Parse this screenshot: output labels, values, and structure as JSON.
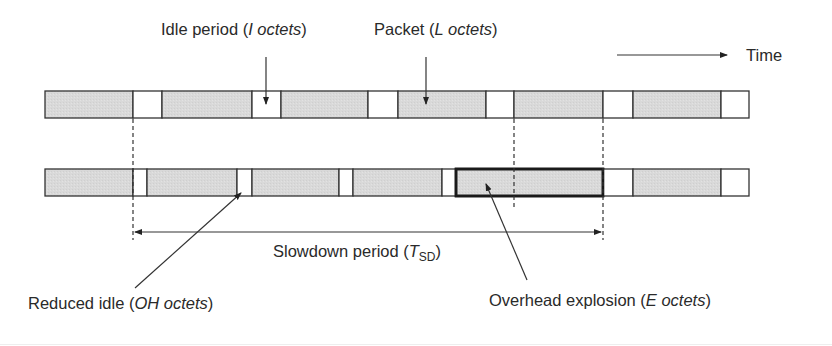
{
  "diagram": {
    "title": "",
    "colors": {
      "packet_fill": "#d9d9d9",
      "idle_fill": "#ffffff",
      "stroke": "#333333"
    },
    "time_axis": {
      "label": "Time"
    },
    "rows": [
      {
        "name": "original-stream",
        "y": 91,
        "height": 27,
        "segments": [
          {
            "type": "packet",
            "x0": 45,
            "x1": 133
          },
          {
            "type": "idle",
            "x0": 133,
            "x1": 162
          },
          {
            "type": "packet",
            "x0": 162,
            "x1": 252
          },
          {
            "type": "idle",
            "x0": 252,
            "x1": 281
          },
          {
            "type": "packet",
            "x0": 281,
            "x1": 368
          },
          {
            "type": "idle",
            "x0": 368,
            "x1": 398
          },
          {
            "type": "packet",
            "x0": 398,
            "x1": 486
          },
          {
            "type": "idle",
            "x0": 486,
            "x1": 514
          },
          {
            "type": "packet",
            "x0": 514,
            "x1": 603
          },
          {
            "type": "idle",
            "x0": 603,
            "x1": 633
          },
          {
            "type": "packet",
            "x0": 633,
            "x1": 721
          },
          {
            "type": "idle",
            "x0": 721,
            "x1": 749
          }
        ]
      },
      {
        "name": "slowed-stream",
        "y": 169,
        "height": 27,
        "segments": [
          {
            "type": "packet",
            "x0": 45,
            "x1": 133
          },
          {
            "type": "idle",
            "x0": 133,
            "x1": 147
          },
          {
            "type": "packet",
            "x0": 147,
            "x1": 237
          },
          {
            "type": "idle",
            "x0": 237,
            "x1": 252
          },
          {
            "type": "packet",
            "x0": 252,
            "x1": 339
          },
          {
            "type": "idle",
            "x0": 339,
            "x1": 353
          },
          {
            "type": "packet",
            "x0": 353,
            "x1": 442
          },
          {
            "type": "idle",
            "x0": 442,
            "x1": 456
          },
          {
            "type": "packet",
            "x0": 456,
            "x1": 603,
            "bold": true
          },
          {
            "type": "idle",
            "x0": 603,
            "x1": 633
          },
          {
            "type": "packet",
            "x0": 633,
            "x1": 721
          },
          {
            "type": "idle",
            "x0": 721,
            "x1": 749
          }
        ]
      }
    ],
    "labels": {
      "idle_period": {
        "text": "Idle period (",
        "var": "I octets",
        "close": ")"
      },
      "packet": {
        "text": "Packet (",
        "var": "L octets",
        "close": ")"
      },
      "time": "Time",
      "slowdown": {
        "text": "Slowdown period (",
        "var": "T",
        "sub": "SD",
        "close": ")"
      },
      "reduced_idle": {
        "text": "Reduced idle (",
        "var": "OH octets",
        "close": ")"
      },
      "overhead_explosion": {
        "text": "Overhead explosion (",
        "var": "E octets",
        "close": ")"
      }
    }
  }
}
